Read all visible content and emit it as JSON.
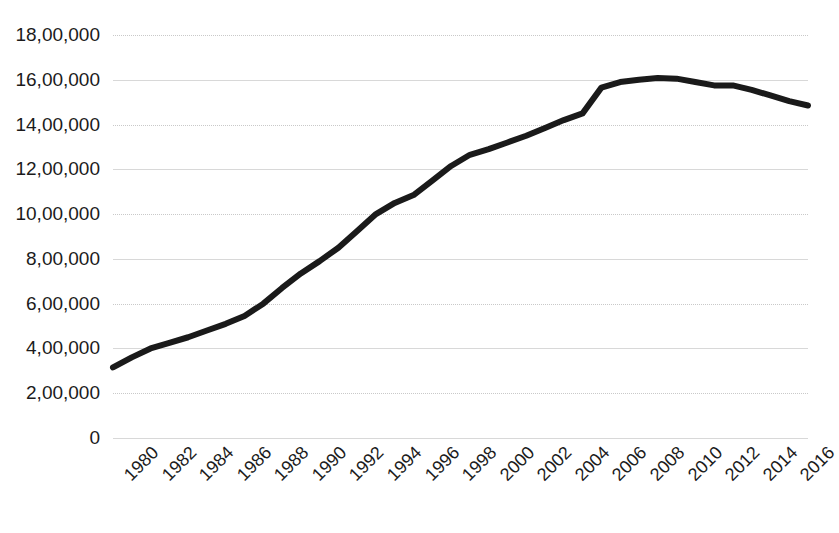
{
  "chart_data": {
    "type": "line",
    "title": "",
    "subtitle": "",
    "xlabel": "",
    "ylabel": "",
    "xlim": [
      1980,
      2017
    ],
    "ylim": [
      0,
      1800000
    ],
    "grid": true,
    "legend": false,
    "legend_position": "none",
    "line_color": "#1a1a1a",
    "line_width": 6,
    "x": [
      1980,
      1981,
      1982,
      1983,
      1984,
      1985,
      1986,
      1987,
      1988,
      1989,
      1990,
      1991,
      1992,
      1993,
      1994,
      1995,
      1996,
      1997,
      1998,
      1999,
      2000,
      2001,
      2002,
      2003,
      2004,
      2005,
      2006,
      2007,
      2008,
      2009,
      2010,
      2011,
      2012,
      2013,
      2014,
      2015,
      2016,
      2017
    ],
    "values": [
      315000,
      360000,
      400000,
      425000,
      450000,
      480000,
      510000,
      545000,
      600000,
      670000,
      735000,
      790000,
      850000,
      925000,
      1000000,
      1050000,
      1085000,
      1150000,
      1215000,
      1265000,
      1290000,
      1320000,
      1350000,
      1385000,
      1420000,
      1450000,
      1565000,
      1590000,
      1600000,
      1608000,
      1605000,
      1590000,
      1575000,
      1575000,
      1555000,
      1530000,
      1505000,
      1485000
    ],
    "y_tick_values": [
      0,
      200000,
      400000,
      600000,
      800000,
      1000000,
      1200000,
      1400000,
      1600000,
      1800000
    ],
    "y_tick_labels": [
      "0",
      "2,00,000",
      "4,00,000",
      "6,00,000",
      "8,00,000",
      "10,00,000",
      "12,00,000",
      "14,00,000",
      "16,00,000",
      "18,00,000"
    ],
    "x_tick_values": [
      1980,
      1982,
      1984,
      1986,
      1988,
      1990,
      1992,
      1994,
      1996,
      1998,
      2000,
      2002,
      2004,
      2006,
      2008,
      2010,
      2012,
      2014,
      2016
    ],
    "x_tick_labels": [
      "1980",
      "1982",
      "1984",
      "1986",
      "1988",
      "1990",
      "1992",
      "1994",
      "1996",
      "1998",
      "2000",
      "2002",
      "2004",
      "2006",
      "2008",
      "2010",
      "2012",
      "2014",
      "2016"
    ],
    "x_tick_rotation": -45,
    "gridline_styles": [
      "solid",
      "dotted",
      "solid",
      "dotted",
      "solid",
      "dotted",
      "solid",
      "dotted",
      "solid",
      "dotted"
    ]
  }
}
